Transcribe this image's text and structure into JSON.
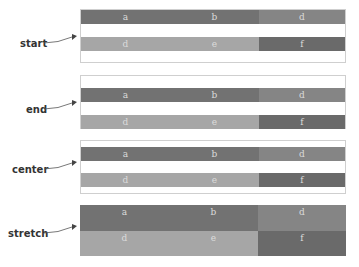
{
  "colors": {
    "row1_cell1": "#727272",
    "row1_cell2": "#727272",
    "row1_cell3": "#858585",
    "row2_cell1": "#a6a6a6",
    "row2_cell2": "#a6a6a6",
    "row2_cell3": "#6a6a6a",
    "cell_text": "#dcdcdc",
    "border": "#cfcfcf"
  },
  "panels": [
    {
      "label": "start",
      "row1": [
        "a",
        "b",
        "d"
      ],
      "row2": [
        "d",
        "e",
        "f"
      ]
    },
    {
      "label": "end",
      "row1": [
        "a",
        "b",
        "d"
      ],
      "row2": [
        "d",
        "e",
        "f"
      ]
    },
    {
      "label": "center",
      "row1": [
        "a",
        "b",
        "d"
      ],
      "row2": [
        "d",
        "e",
        "f"
      ]
    },
    {
      "label": "stretch",
      "row1": [
        "a",
        "b",
        "d"
      ],
      "row2": [
        "d",
        "e",
        "f"
      ]
    }
  ]
}
